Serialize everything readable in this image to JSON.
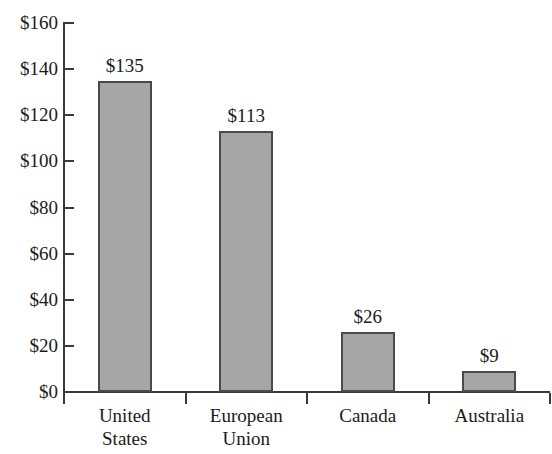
{
  "chart_data": {
    "type": "bar",
    "title": "",
    "subtitle": "",
    "xlabel": "",
    "ylabel": "",
    "categories": [
      "United States",
      "European Union",
      "Canada",
      "Australia"
    ],
    "category_lines": [
      [
        "United",
        "States"
      ],
      [
        "European",
        "Union"
      ],
      [
        "Canada"
      ],
      [
        "Australia"
      ]
    ],
    "values": [
      135,
      113,
      26,
      9
    ],
    "data_labels": [
      "$135",
      "$113",
      "$26",
      "$9"
    ],
    "ylim": [
      0,
      160
    ],
    "ytick_values": [
      0,
      20,
      40,
      60,
      80,
      100,
      120,
      140,
      160
    ],
    "ytick_labels": [
      "$0",
      "$20",
      "$40",
      "$60",
      "$80",
      "$100",
      "$120",
      "$140",
      "$160"
    ],
    "grid": false,
    "legend": false,
    "legend_position": "none",
    "currency_prefix": "$",
    "bar_fill_color": "#a6a6a6",
    "bar_border_color": "#4a4a4a",
    "axis_color": "#3a3a3a",
    "background_color": "#ffffff"
  }
}
